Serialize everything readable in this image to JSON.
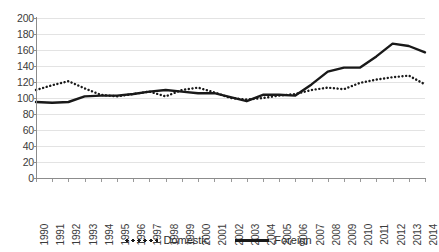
{
  "chart_data": {
    "type": "line",
    "title": "",
    "xlabel": "",
    "ylabel": "",
    "ylim": [
      0,
      200
    ],
    "ytick_step": 20,
    "grid": true,
    "legend_position": "bottom",
    "categories": [
      "1990",
      "1991",
      "1992",
      "1993",
      "1994",
      "1995",
      "1996",
      "1997",
      "1998",
      "1999",
      "2000",
      "2001",
      "2002",
      "2003",
      "2004",
      "2005",
      "2006",
      "2007",
      "2008",
      "2009",
      "2010",
      "2011",
      "2012",
      "2013",
      "2014"
    ],
    "yticks": [
      "0",
      "20",
      "40",
      "60",
      "80",
      "100",
      "120",
      "140",
      "160",
      "180",
      "200"
    ],
    "series": [
      {
        "name": "Domestic",
        "style": "dotted",
        "color": "#191919",
        "values": [
          110,
          116,
          121,
          112,
          104,
          102,
          105,
          108,
          102,
          110,
          113,
          107,
          100,
          98,
          100,
          103,
          105,
          110,
          113,
          111,
          119,
          123,
          126,
          128,
          117
        ]
      },
      {
        "name": "Foreign",
        "style": "solid",
        "color": "#191919",
        "values": [
          95,
          94,
          95,
          102,
          103,
          103,
          105,
          108,
          110,
          108,
          106,
          106,
          101,
          96,
          104,
          104,
          103,
          117,
          133,
          138,
          138,
          152,
          168,
          165,
          157
        ]
      }
    ]
  },
  "legend": {
    "entries": [
      {
        "label": "Domestic",
        "style": "dotted"
      },
      {
        "label": "Foreign",
        "style": "solid"
      }
    ]
  },
  "clipped_top_text": ""
}
